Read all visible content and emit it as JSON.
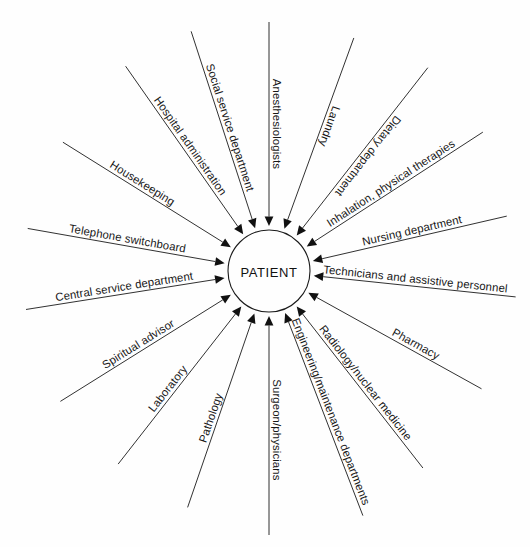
{
  "diagram": {
    "type": "radial-hub-and-spoke",
    "title": "",
    "hub": {
      "label": "PATIENT",
      "center_x": 269,
      "center_y": 271,
      "radius": 41,
      "fill": "#fefefe",
      "stroke": "#1a1a1a"
    },
    "arrow_direction": "inward",
    "spoke_count": 17,
    "line_color": "#1a1a1a",
    "background": "#fefefe",
    "spokes": [
      {
        "label": "Anesthesiologists",
        "angle_deg": -90,
        "outer_radius": 249,
        "text_offset": 0.5,
        "flip": true
      },
      {
        "label": "Laundry",
        "angle_deg": -70,
        "outer_radius": 248,
        "text_offset": 0.55,
        "flip": true
      },
      {
        "label": "Dietary department",
        "angle_deg": -52,
        "outer_radius": 258,
        "text_offset": 0.5,
        "flip": true
      },
      {
        "label": "Inhalation, physical therapies",
        "angle_deg": -33,
        "outer_radius": 255,
        "text_offset": 0.5,
        "flip": false
      },
      {
        "label": "Nursing department",
        "angle_deg": -13,
        "outer_radius": 244,
        "text_offset": 0.52,
        "flip": false
      },
      {
        "label": "Technicians and assistive personnel",
        "angle_deg": 6,
        "outer_radius": 248,
        "text_offset": 0.5,
        "flip": false
      },
      {
        "label": "Pharmacy",
        "angle_deg": 29,
        "outer_radius": 243,
        "text_offset": 0.6,
        "flip": false
      },
      {
        "label": "Radiology/nuclear medicine",
        "angle_deg": 52,
        "outer_radius": 250,
        "text_offset": 0.5,
        "flip": false
      },
      {
        "label": "Engineering/maintenance departments",
        "angle_deg": 69,
        "outer_radius": 262,
        "text_offset": 0.5,
        "flip": false
      },
      {
        "label": "Surgeon/physicians",
        "angle_deg": 90,
        "outer_radius": 264,
        "text_offset": 0.52,
        "flip": false
      },
      {
        "label": "Pathology",
        "angle_deg": 109,
        "outer_radius": 250,
        "text_offset": 0.55,
        "flip": true
      },
      {
        "label": "Laboratory",
        "angle_deg": 128,
        "outer_radius": 245,
        "text_offset": 0.55,
        "flip": true
      },
      {
        "label": "Spiritual advisor",
        "angle_deg": 148,
        "outer_radius": 246,
        "text_offset": 0.52,
        "flip": true
      },
      {
        "label": "Central service department",
        "angle_deg": 171,
        "outer_radius": 246,
        "text_offset": 0.5,
        "flip": true
      },
      {
        "label": "Telephone switchboard",
        "angle_deg": -170,
        "outer_radius": 245,
        "text_offset": 0.5,
        "flip": true
      },
      {
        "label": "Housekeeping",
        "angle_deg": -148,
        "outer_radius": 243,
        "text_offset": 0.55,
        "flip": true
      },
      {
        "label": "Hospital administration",
        "angle_deg": -125,
        "outer_radius": 250,
        "text_offset": 0.5,
        "flip": true
      },
      {
        "label": "Social service department",
        "angle_deg": -108,
        "outer_radius": 252,
        "text_offset": 0.5,
        "flip": true
      }
    ]
  }
}
